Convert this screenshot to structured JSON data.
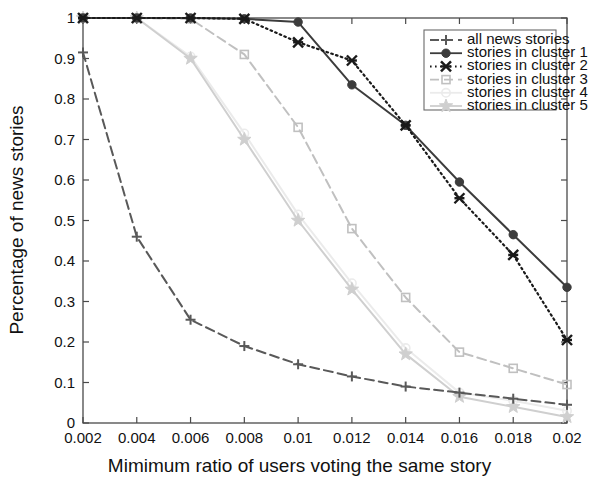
{
  "chart_data": {
    "type": "line",
    "title": "",
    "xlabel": "Mimimum ratio of users voting the same story",
    "ylabel": "Percentage of news stories",
    "x": [
      0.002,
      0.004,
      0.006,
      0.008,
      0.01,
      0.012,
      0.014,
      0.016,
      0.018,
      0.02
    ],
    "xtick_labels": [
      "0.002",
      "0.004",
      "0.006",
      "0.008",
      "0.01",
      "0.012",
      "0.014",
      "0.016",
      "0.018",
      "0.02"
    ],
    "ytick_labels": [
      "0",
      "0.1",
      "0.2",
      "0.3",
      "0.4",
      "0.5",
      "0.6",
      "0.7",
      "0.8",
      "0.9",
      "1"
    ],
    "xlim": [
      0.002,
      0.02
    ],
    "ylim": [
      0,
      1
    ],
    "grid": false,
    "legend_position": "top-right",
    "series": [
      {
        "name": "all news stories",
        "legend_label": "all news stories",
        "color": "#595959",
        "marker": "plus",
        "dash": "dashed",
        "values": [
          0.915,
          0.46,
          0.255,
          0.19,
          0.145,
          0.115,
          0.09,
          0.075,
          0.06,
          0.045
        ]
      },
      {
        "name": "stories in cluster 1",
        "legend_label": "stories in cluster 1",
        "color": "#3c3c3c",
        "marker": "circle",
        "dash": "solid",
        "values": [
          1.0,
          1.0,
          1.0,
          0.998,
          0.99,
          0.835,
          0.735,
          0.595,
          0.465,
          0.335
        ]
      },
      {
        "name": "stories in cluster 2",
        "legend_label": "stories in cluster 2",
        "color": "#1a1a1a",
        "marker": "cross",
        "dash": "dotted",
        "values": [
          1.0,
          1.0,
          1.0,
          0.998,
          0.94,
          0.895,
          0.735,
          0.555,
          0.415,
          0.205
        ]
      },
      {
        "name": "stories in cluster 3",
        "legend_label": "stories in cluster 3",
        "color": "#c0c0c0",
        "marker": "square",
        "dash": "dashed",
        "values": [
          1.0,
          1.0,
          0.998,
          0.91,
          0.73,
          0.48,
          0.31,
          0.175,
          0.135,
          0.095
        ]
      },
      {
        "name": "stories in cluster 4",
        "legend_label": "stories in cluster 4",
        "color": "#ebebeb",
        "marker": "circle-open",
        "dash": "solid",
        "values": [
          1.0,
          1.0,
          0.905,
          0.715,
          0.515,
          0.345,
          0.185,
          0.075,
          0.055,
          0.03
        ]
      },
      {
        "name": "stories in cluster 5",
        "legend_label": "stories in cluster 5",
        "color": "#cfcfcf",
        "marker": "star",
        "dash": "solid",
        "values": [
          1.0,
          1.0,
          0.9,
          0.7,
          0.5,
          0.33,
          0.17,
          0.065,
          0.04,
          0.015
        ]
      }
    ]
  },
  "axes": {
    "xlabel": "Mimimum ratio of users voting the same story",
    "ylabel": "Percentage of news stories"
  }
}
